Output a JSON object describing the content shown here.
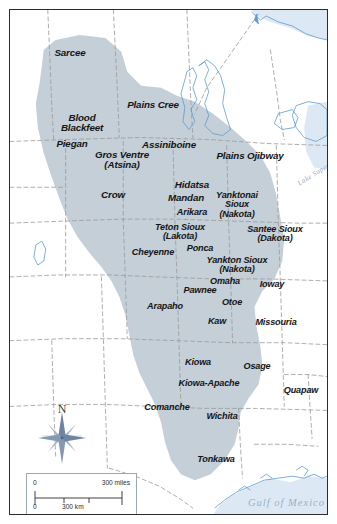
{
  "figure": {
    "frame_color": "#2b2b2b",
    "page_background": "#ffffff"
  },
  "map": {
    "plains_region_color": "#c4cfd8",
    "land_color": "#ffffff",
    "water_color": "#dce9f4",
    "coast_line_color": "#5b9bd5",
    "border_line_color": "#9a9a9a",
    "tribe_label_color": "#151515",
    "water_label_color": "#93aac1"
  },
  "tribes": [
    {
      "name": "Sarcee",
      "x": 60,
      "y": 43,
      "size": "sz-lg"
    },
    {
      "name": "Plains Cree",
      "x": 143,
      "y": 95,
      "size": "sz-lg"
    },
    {
      "name": "Blood\nBlackfeet",
      "x": 72,
      "y": 113,
      "size": "sz-lg"
    },
    {
      "name": "Piegan",
      "x": 62,
      "y": 134,
      "size": "sz-lg"
    },
    {
      "name": "Assiniboine",
      "x": 159,
      "y": 135,
      "size": "sz-lg"
    },
    {
      "name": "Gros Ventre\n(Atsina)",
      "x": 112,
      "y": 150,
      "size": "sz-lg"
    },
    {
      "name": "Plains Ojibway",
      "x": 240,
      "y": 146,
      "size": "sz-lg"
    },
    {
      "name": "Crow",
      "x": 103,
      "y": 185,
      "size": "sz-lg"
    },
    {
      "name": "Hidatsa",
      "x": 182,
      "y": 175,
      "size": "sz-lg"
    },
    {
      "name": "Mandan",
      "x": 176,
      "y": 188,
      "size": "sz-lg"
    },
    {
      "name": "Yanktonai\nSioux\n(Nakota)",
      "x": 227,
      "y": 195,
      "size": "sz-md"
    },
    {
      "name": "Arikara",
      "x": 182,
      "y": 203,
      "size": "sz-md"
    },
    {
      "name": "Teton Sioux\n(Lakota)",
      "x": 170,
      "y": 222,
      "size": "sz-md"
    },
    {
      "name": "Santee Sioux\n(Dakota)",
      "x": 265,
      "y": 224,
      "size": "sz-md"
    },
    {
      "name": "Cheyenne",
      "x": 143,
      "y": 243,
      "size": "sz-md"
    },
    {
      "name": "Ponca",
      "x": 190,
      "y": 239,
      "size": "sz-md"
    },
    {
      "name": "Yankton Sioux\n(Nakota)",
      "x": 227,
      "y": 255,
      "size": "sz-md"
    },
    {
      "name": "Omaha",
      "x": 215,
      "y": 272,
      "size": "sz-md"
    },
    {
      "name": "Ioway",
      "x": 262,
      "y": 275,
      "size": "sz-md"
    },
    {
      "name": "Pawnee",
      "x": 190,
      "y": 281,
      "size": "sz-md"
    },
    {
      "name": "Otoe",
      "x": 222,
      "y": 293,
      "size": "sz-md"
    },
    {
      "name": "Arapaho",
      "x": 155,
      "y": 297,
      "size": "sz-md"
    },
    {
      "name": "Kaw",
      "x": 207,
      "y": 312,
      "size": "sz-md"
    },
    {
      "name": "Missouria",
      "x": 266,
      "y": 313,
      "size": "sz-md"
    },
    {
      "name": "Kiowa",
      "x": 188,
      "y": 353,
      "size": "sz-md"
    },
    {
      "name": "Osage",
      "x": 247,
      "y": 357,
      "size": "sz-md"
    },
    {
      "name": "Kiowa-Apache",
      "x": 199,
      "y": 374,
      "size": "sz-md"
    },
    {
      "name": "Quapaw",
      "x": 291,
      "y": 381,
      "size": "sz-md"
    },
    {
      "name": "Comanche",
      "x": 157,
      "y": 398,
      "size": "sz-md"
    },
    {
      "name": "Wichita",
      "x": 212,
      "y": 407,
      "size": "sz-md"
    },
    {
      "name": "Tonkawa",
      "x": 206,
      "y": 450,
      "size": "sz-md"
    }
  ],
  "water_labels": {
    "gulf_of_mexico": "Gulf of Mexico",
    "lake_superior": "Lake Superior"
  },
  "compass": {
    "north_label": "N"
  },
  "scale_bar": {
    "miles_zero": "0",
    "miles_max": "300 miles",
    "km_zero": "0",
    "km_max": "300 km"
  }
}
